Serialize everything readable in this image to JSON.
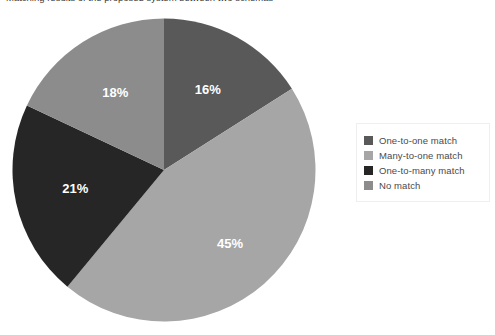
{
  "caption": {
    "text": "Matching results of the proposed system between two schemas"
  },
  "chart_data": {
    "type": "pie",
    "title": "",
    "subtitle": "",
    "xlabel": "",
    "ylabel": "",
    "grid": false,
    "legend_position": "right",
    "start_angle_deg": 0,
    "direction": "clockwise",
    "categories": [
      "One-to-one match",
      "Many-to-one match",
      "One-to-many match",
      "No match"
    ],
    "values": [
      16,
      45,
      21,
      18
    ],
    "value_unit": "%",
    "data_labels": [
      "16%",
      "45%",
      "21%",
      "18%"
    ],
    "colors": [
      "#595959",
      "#a6a6a6",
      "#262626",
      "#8c8c8c"
    ],
    "slices": [
      {
        "label": "One-to-one match",
        "value": 16,
        "display": "16%",
        "color": "#595959",
        "start_deg": 0,
        "end_deg": 57.6
      },
      {
        "label": "Many-to-one match",
        "value": 45,
        "display": "45%",
        "color": "#a6a6a6",
        "start_deg": 57.6,
        "end_deg": 219.6
      },
      {
        "label": "One-to-many match",
        "value": 21,
        "display": "21%",
        "color": "#262626",
        "start_deg": 219.6,
        "end_deg": 295.2
      },
      {
        "label": "No match",
        "value": 18,
        "display": "18%",
        "color": "#8c8c8c",
        "start_deg": 295.2,
        "end_deg": 360
      }
    ]
  },
  "legend": {
    "items": [
      {
        "label": "One-to-one match",
        "color": "#595959"
      },
      {
        "label": "Many-to-one match",
        "color": "#a6a6a6"
      },
      {
        "label": "One-to-many match",
        "color": "#262626"
      },
      {
        "label": "No match",
        "color": "#8c8c8c"
      }
    ]
  }
}
